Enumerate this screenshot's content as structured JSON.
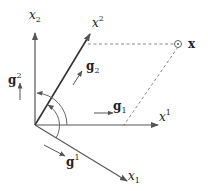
{
  "diagram": {
    "colors": {
      "axis": "#555555",
      "dashed": "#888888",
      "text": "#222222",
      "background": "#ffffff"
    },
    "axes": {
      "x_lower_2": {
        "base": "x",
        "index": "2",
        "position": "subscript"
      },
      "x_upper_2": {
        "base": "x",
        "index": "2",
        "position": "superscript"
      },
      "x_upper_1": {
        "base": "x",
        "index": "1",
        "position": "superscript"
      },
      "x_lower_1": {
        "base": "x",
        "index": "1",
        "position": "subscript"
      }
    },
    "vectors": {
      "g_upper_2": {
        "base": "g",
        "index": "2",
        "position": "superscript"
      },
      "g_lower_2": {
        "base": "g",
        "index": "2",
        "position": "subscript"
      },
      "g_lower_1": {
        "base": "g",
        "index": "1",
        "position": "subscript"
      },
      "g_upper_1": {
        "base": "g",
        "index": "1",
        "position": "superscript"
      }
    },
    "point": {
      "label": "x"
    }
  }
}
